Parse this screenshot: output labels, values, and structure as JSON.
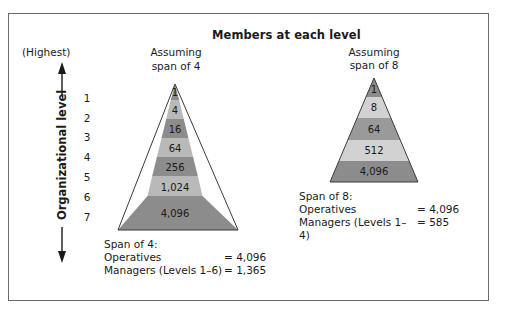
{
  "title": "Members at each level",
  "axis": {
    "label": "Organizational level",
    "top_label": "(Highest)",
    "levels": [
      "1",
      "2",
      "3",
      "4",
      "5",
      "6",
      "7"
    ]
  },
  "pyramids": [
    {
      "id": "span4",
      "heading_line1": "Assuming",
      "heading_line2": "span of 4",
      "bands": [
        "1",
        "4",
        "16",
        "64",
        "256",
        "1,024",
        "4,096"
      ],
      "summary": {
        "title": "Span of 4:",
        "rows": [
          {
            "label": "Operatives",
            "value": "= 4,096"
          },
          {
            "label": "Managers (Levels 1–6)",
            "value": "= 1,365"
          }
        ]
      }
    },
    {
      "id": "span8",
      "heading_line1": "Assuming",
      "heading_line2": "span of 8",
      "bands": [
        "1",
        "8",
        "64",
        "512",
        "4,096"
      ],
      "summary": {
        "title": "Span of 8:",
        "rows": [
          {
            "label": "Operatives",
            "value": "= 4,096"
          },
          {
            "label": "Managers (Levels 1–4)",
            "value": "= 585"
          }
        ]
      }
    }
  ],
  "colors": {
    "dark_band": "#8c8c8c",
    "light_band": "#b9b9b9",
    "pale_band": "#d2d2d2",
    "outline": "#3a3a3a"
  }
}
